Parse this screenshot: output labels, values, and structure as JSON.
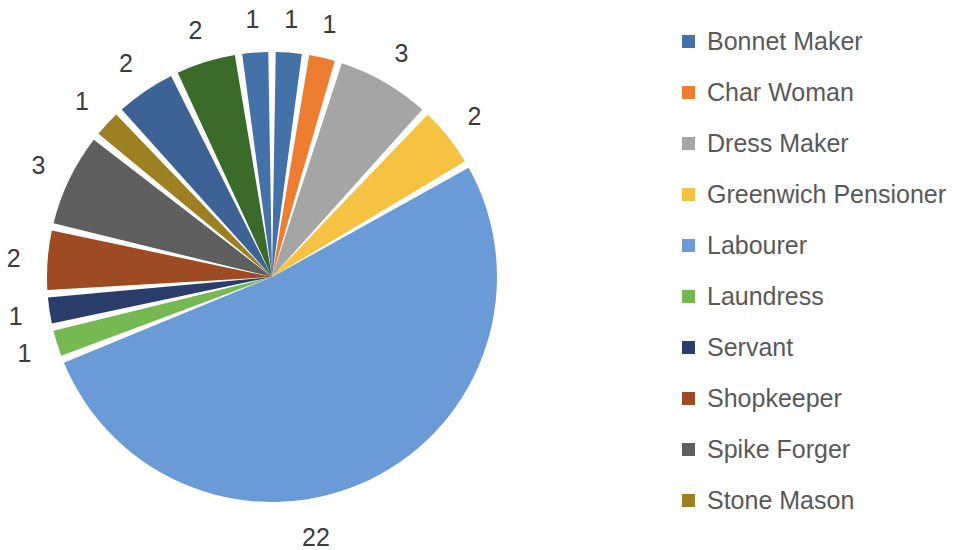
{
  "chart_data": {
    "type": "pie",
    "title": "",
    "total": 42,
    "legend_position": "right",
    "legend_truncated": true,
    "categories": [
      "Bonnet Maker",
      "Char Woman",
      "Dress Maker",
      "Greenwich Pensioner",
      "Labourer",
      "Laundress",
      "Servant",
      "Shopkeeper",
      "Spike Forger",
      "Stone Mason"
    ],
    "values": [
      1,
      1,
      3,
      2,
      22,
      1,
      1,
      2,
      3,
      1
    ],
    "slices": [
      {
        "label": "Bonnet Maker",
        "value": 1,
        "color": "#4472a8",
        "data_label": "1"
      },
      {
        "label": "Char Woman",
        "value": 1,
        "color": "#ed7d31",
        "data_label": "1"
      },
      {
        "label": "Dress Maker",
        "value": 3,
        "color": "#a5a5a5",
        "data_label": "3"
      },
      {
        "label": "Greenwich Pensioner",
        "value": 2,
        "color": "#f5c242",
        "data_label": "2"
      },
      {
        "label": "Labourer",
        "value": 22,
        "color": "#6b9bd6",
        "data_label": "22"
      },
      {
        "label": "Laundress",
        "value": 1,
        "color": "#76b852",
        "data_label": "1"
      },
      {
        "label": "Servant",
        "value": 1,
        "color": "#2b3d6b",
        "data_label": "1"
      },
      {
        "label": "Shopkeeper",
        "value": 2,
        "color": "#9e4a22",
        "data_label": "2"
      },
      {
        "label": "Spike Forger",
        "value": 3,
        "color": "#5f5f5f",
        "data_label": "3"
      },
      {
        "label": "Stone Mason",
        "value": 1,
        "color": "#9c8022",
        "data_label": "1"
      },
      {
        "label": "",
        "value": 2,
        "color": "#3d6296",
        "data_label": "2"
      },
      {
        "label": "",
        "value": 2,
        "color": "#3b6b2b",
        "data_label": "2"
      },
      {
        "label": "",
        "value": 1,
        "color": "#4472a8",
        "data_label": "1"
      }
    ],
    "data_labels": [
      "1",
      "1",
      "3",
      "2",
      "22",
      "1",
      "1",
      "2",
      "3",
      "1",
      "2",
      "2",
      "1"
    ]
  },
  "legend": {
    "items": [
      {
        "label": "Bonnet Maker",
        "color": "#4472a8"
      },
      {
        "label": "Char Woman",
        "color": "#ed7d31"
      },
      {
        "label": "Dress Maker",
        "color": "#a5a5a5"
      },
      {
        "label": "Greenwich Pensioner",
        "color": "#f5c242"
      },
      {
        "label": "Labourer",
        "color": "#6b9bd6"
      },
      {
        "label": "Laundress",
        "color": "#76b852"
      },
      {
        "label": "Servant",
        "color": "#2b3d6b"
      },
      {
        "label": "Shopkeeper",
        "color": "#9e4a22"
      },
      {
        "label": "Spike Forger",
        "color": "#5f5f5f"
      },
      {
        "label": "Stone Mason",
        "color": "#9c8022"
      }
    ]
  }
}
